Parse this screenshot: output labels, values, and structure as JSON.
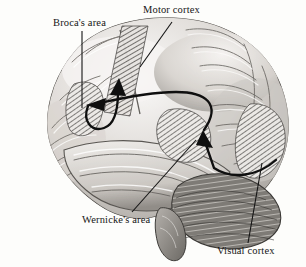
{
  "figure": {
    "kind": "anatomical-illustration",
    "style": "grayscale halftone engraving",
    "background_color": "#fdfdfb",
    "ink_color": "#161616"
  },
  "labels": {
    "broca": "Broca's area",
    "motor": "Motor cortex",
    "wernicke": "Wernicke's area",
    "visual": "Visual cortex"
  },
  "regions": [
    {
      "id": "broca",
      "name": "Broca's area",
      "shading": "diagonal-hatch",
      "leader": "vertical-line-down"
    },
    {
      "id": "motor",
      "name": "Motor cortex",
      "shading": "diagonal-hatch-band",
      "leader": "diagonal-line-down-left"
    },
    {
      "id": "wernicke",
      "name": "Wernicke's area",
      "shading": "diagonal-hatch",
      "leader": "diagonal-line-up-right"
    },
    {
      "id": "visual",
      "name": "Visual cortex",
      "shading": "diagonal-hatch",
      "leader": "vertical-line-up"
    }
  ],
  "pathways": [
    {
      "id": "visual-to-wernicke",
      "name": "visual cortex to Wernicke's area",
      "style": "solid-curved-arrow"
    },
    {
      "id": "wernicke-to-broca",
      "name": "Wernicke's area to Broca's area",
      "style": "solid-curved-arrow"
    },
    {
      "id": "broca-to-motor",
      "name": "Broca's area to motor cortex",
      "style": "solid-curved-arrow"
    }
  ],
  "colors": {
    "ink": "#161616",
    "paper": "#fdfdfb",
    "cortex_light": "#f2f0ee",
    "cortex_mid": "#c9c6c2",
    "cortex_dark": "#8e8b87",
    "cerebellum": "#6f6c68"
  }
}
